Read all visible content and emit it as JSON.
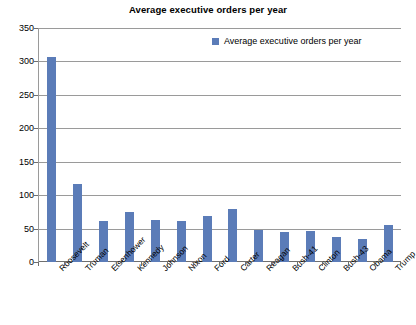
{
  "chart_data": {
    "type": "bar",
    "title": "Average executive orders per year",
    "xlabel": "",
    "ylabel": "",
    "ylim": [
      0,
      350
    ],
    "ytick_step": 50,
    "yticks": [
      0,
      50,
      100,
      150,
      200,
      250,
      300,
      350
    ],
    "grid": true,
    "legend_position": "top-right-inside",
    "legend": [
      "Average executive orders per year"
    ],
    "series_color": "#5b7cb8",
    "categories": [
      "Roosevelt",
      "Truman",
      "Eisenhower",
      "Kennedy",
      "Johnson",
      "Nixon",
      "Ford",
      "Carter",
      "Reagan",
      "Bush-41",
      "Clinton",
      "Bush-43",
      "Obama",
      "Trump"
    ],
    "values": [
      307,
      117,
      62,
      75,
      63,
      62,
      69,
      80,
      48,
      45,
      46,
      37,
      35,
      55
    ],
    "series": [
      {
        "name": "Average executive orders per year",
        "values": [
          307,
          117,
          62,
          75,
          63,
          62,
          69,
          80,
          48,
          45,
          46,
          37,
          35,
          55
        ]
      }
    ]
  }
}
